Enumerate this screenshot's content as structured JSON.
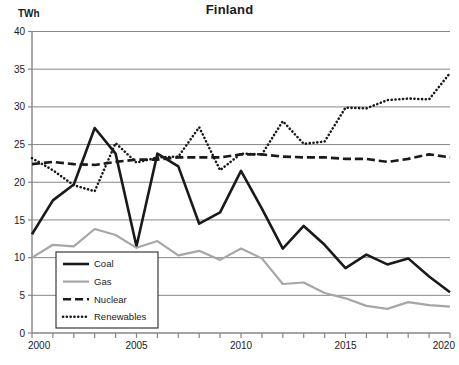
{
  "chart_data": {
    "type": "line",
    "title": "Finland",
    "ylabel": "TWh",
    "xlabel": "",
    "xlim": [
      2000,
      2020
    ],
    "ylim": [
      0,
      40
    ],
    "ytick_values": [
      0,
      5,
      10,
      15,
      20,
      25,
      30,
      35,
      40
    ],
    "ytick_labels": [
      "0",
      "5",
      "10",
      "15",
      "20",
      "25",
      "30",
      "35",
      "40"
    ],
    "xtick_values": [
      2000,
      2001,
      2002,
      2003,
      2004,
      2005,
      2006,
      2007,
      2008,
      2009,
      2010,
      2011,
      2012,
      2013,
      2014,
      2015,
      2016,
      2017,
      2018,
      2019,
      2020
    ],
    "xtick_labels_shown": [
      "2000",
      "2005",
      "2010",
      "2015",
      "2020"
    ],
    "xtick_labels_shown_values": [
      2000,
      2005,
      2010,
      2015,
      2020
    ],
    "grid": "horizontal",
    "legend_position": "bottom-left",
    "x": [
      2000,
      2001,
      2002,
      2003,
      2004,
      2005,
      2006,
      2007,
      2008,
      2009,
      2010,
      2011,
      2012,
      2013,
      2014,
      2015,
      2016,
      2017,
      2018,
      2019,
      2020
    ],
    "series": [
      {
        "name": "Coal",
        "style": "solid",
        "color": "#1a1a1a",
        "width": 2.6,
        "values": [
          13.1,
          17.6,
          19.7,
          27.2,
          23.8,
          11.5,
          23.8,
          22.1,
          14.5,
          16.0,
          21.5,
          16.5,
          11.2,
          14.2,
          11.7,
          8.6,
          10.4,
          9.1,
          9.9,
          7.5,
          5.4
        ]
      },
      {
        "name": "Gas",
        "style": "solid",
        "color": "#a6a6a6",
        "width": 2.2,
        "values": [
          10.0,
          11.7,
          11.5,
          13.8,
          13.0,
          11.3,
          12.2,
          10.3,
          10.9,
          9.7,
          11.2,
          9.9,
          6.5,
          6.7,
          5.3,
          4.6,
          3.6,
          3.2,
          4.1,
          3.7,
          3.5
        ]
      },
      {
        "name": "Nuclear",
        "style": "dashed",
        "color": "#1a1a1a",
        "width": 2.6,
        "values": [
          22.4,
          22.7,
          22.4,
          22.3,
          22.7,
          23.0,
          23.0,
          23.3,
          23.3,
          23.3,
          23.7,
          23.7,
          23.4,
          23.3,
          23.3,
          23.1,
          23.1,
          22.7,
          23.1,
          23.7,
          23.3
        ]
      },
      {
        "name": "Renewables",
        "style": "dotted",
        "color": "#1a1a1a",
        "width": 2.6,
        "values": [
          23.2,
          21.6,
          19.6,
          18.8,
          25.2,
          22.6,
          23.3,
          23.4,
          27.3,
          21.6,
          23.8,
          23.7,
          28.1,
          25.1,
          25.4,
          29.9,
          29.8,
          30.9,
          31.1,
          31.0,
          34.5
        ]
      }
    ]
  },
  "legend": {
    "items": [
      {
        "label": "Coal"
      },
      {
        "label": "Gas"
      },
      {
        "label": "Nuclear"
      },
      {
        "label": "Renewables"
      }
    ]
  }
}
